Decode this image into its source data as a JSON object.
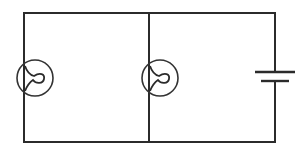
{
  "diagram": {
    "type": "circuit-schematic",
    "colors": {
      "line": "#2b2b2b",
      "background": "#ffffff"
    },
    "components": [
      {
        "id": "lamp-1",
        "kind": "lamp",
        "position": "left branch"
      },
      {
        "id": "lamp-2",
        "kind": "lamp",
        "position": "middle branch"
      },
      {
        "id": "battery",
        "kind": "cell",
        "position": "right branch"
      }
    ],
    "connection": "parallel"
  }
}
